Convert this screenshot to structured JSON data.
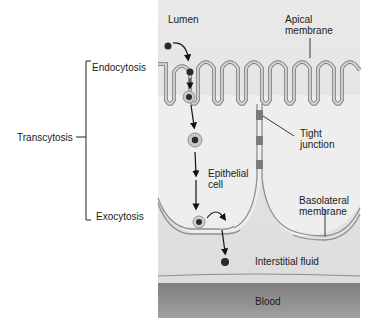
{
  "labels": {
    "lumen": "Lumen",
    "apical": [
      "Apical",
      "membrane"
    ],
    "endocytosis": "Endocytosis",
    "transcytosis": "Transcytosis",
    "exocytosis": "Exocytosis",
    "tight_junction": [
      "Tight",
      "junction"
    ],
    "epithelial_cell": [
      "Epithelial",
      "cell"
    ],
    "basolateral": [
      "Basolateral",
      "membrane"
    ],
    "interstitial_fluid": "Interstitial fluid",
    "blood": "Blood"
  },
  "colors": {
    "panel": "#e6e6e6",
    "membrane": "#9a9a9a",
    "blood": "#8c8c8c",
    "junction": "#7a7a7a",
    "particle": "#2a2a2a"
  }
}
